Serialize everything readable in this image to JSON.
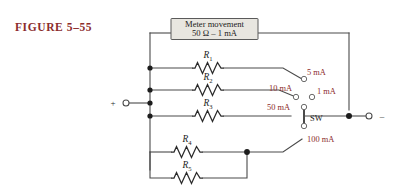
{
  "figure": {
    "label": "FIGURE 5–55"
  },
  "meter": {
    "title": "Meter movement",
    "rating": "50 Ω – 1 mA"
  },
  "resistors": [
    {
      "id": "R1",
      "name": "R",
      "sub": "1"
    },
    {
      "id": "R2",
      "name": "R",
      "sub": "2"
    },
    {
      "id": "R3",
      "name": "R",
      "sub": "3"
    },
    {
      "id": "R4",
      "name": "R",
      "sub": "4"
    },
    {
      "id": "R5",
      "name": "R",
      "sub": "5"
    }
  ],
  "switch": {
    "label": "SW",
    "ranges": [
      {
        "id": "range-1ma",
        "label": "1 mA"
      },
      {
        "id": "range-5ma",
        "label": "5 mA"
      },
      {
        "id": "range-10ma",
        "label": "10 mA"
      },
      {
        "id": "range-50ma",
        "label": "50 mA"
      },
      {
        "id": "range-100ma",
        "label": "100 mA"
      }
    ]
  },
  "terminals": {
    "positive": "+",
    "negative": "–"
  },
  "colors": {
    "accent_red": "#8c2d2d",
    "wire": "#4a4a4a",
    "component": "#2b2b2b",
    "box_fill": "#e8e6e0",
    "background": "#ffffff"
  }
}
